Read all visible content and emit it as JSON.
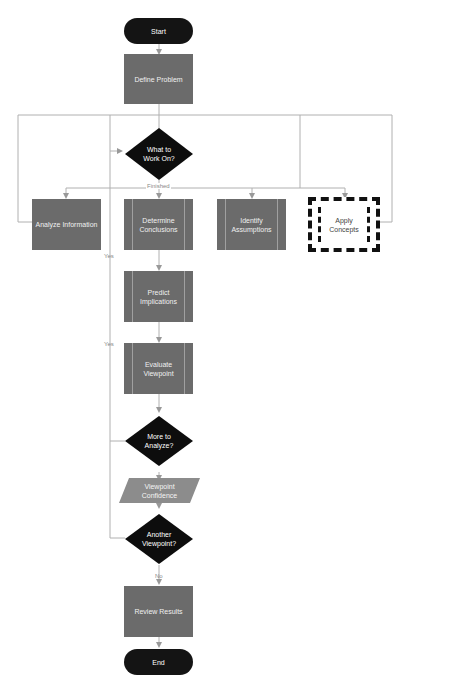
{
  "diagram": {
    "nodes": {
      "start": "Start",
      "define_problem": "Define Problem",
      "what_to_work_on": "What to Work On?",
      "analyze_information": "Analyze Information",
      "determine_conclusions": "Determine Conclusions",
      "identify_assumptions": "Identify Assumptions",
      "apply_concepts": "Apply Concepts",
      "predict_implications": "Predict Implications",
      "evaluate_viewpoint": "Evaluate Viewpoint",
      "more_to_analyze": "More to Analyze?",
      "viewpoint_confidence": "Viewpoint Confidence",
      "another_viewpoint": "Another Viewpoint?",
      "review_results": "Review Results",
      "end": "End"
    },
    "edge_labels": {
      "finished": "Finished",
      "yes_1": "Yes",
      "yes_2": "Yes",
      "no": "No"
    },
    "colors": {
      "process": "#6b6b6b",
      "terminal": "#141414",
      "decision": "#0d0d0d",
      "data": "#8c8c8c",
      "connector": "#b0b0b0"
    }
  }
}
